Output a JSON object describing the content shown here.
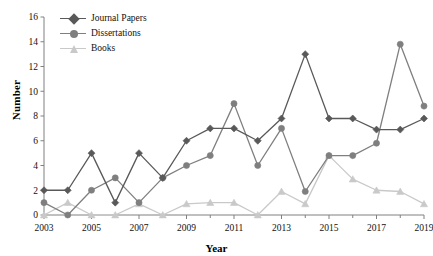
{
  "chart_data": {
    "type": "line",
    "title": "",
    "xlabel": "Year",
    "ylabel": "Number",
    "x": [
      2003,
      2004,
      2005,
      2006,
      2007,
      2008,
      2009,
      2010,
      2011,
      2012,
      2013,
      2014,
      2015,
      2016,
      2017,
      2018,
      2019
    ],
    "xlim": [
      2003,
      2019
    ],
    "ylim": [
      0,
      16
    ],
    "ytick_labels": [
      "0",
      "2",
      "4",
      "6",
      "8",
      "10",
      "12",
      "14",
      "16"
    ],
    "yticks": [
      0,
      2,
      4,
      6,
      8,
      10,
      12,
      14,
      16
    ],
    "xtick_labels": [
      "2003",
      "2005",
      "2007",
      "2009",
      "2011",
      "2013",
      "2015",
      "2017",
      "2019"
    ],
    "xticks": [
      2003,
      2005,
      2007,
      2009,
      2011,
      2013,
      2015,
      2017,
      2019
    ],
    "grid": false,
    "legend_position": "top-left",
    "series": [
      {
        "name": "Journal Papers",
        "marker": "diamond",
        "color": "#595959",
        "values": [
          2,
          2,
          5,
          1,
          5,
          3,
          6,
          7,
          7,
          6,
          7.8,
          13,
          7.8,
          7.8,
          6.9,
          6.9,
          7.8
        ]
      },
      {
        "name": "Dissertations",
        "marker": "circle",
        "color": "#7f7f7f",
        "values": [
          1,
          0,
          2,
          3,
          1,
          3,
          4,
          4.8,
          9,
          4,
          7,
          1.9,
          4.8,
          4.8,
          5.8,
          13.8,
          8.8
        ]
      },
      {
        "name": "Books",
        "marker": "triangle",
        "color": "#c9c9c9",
        "values": [
          0,
          1,
          0,
          0,
          0.9,
          0,
          0.9,
          1,
          1,
          0,
          1.9,
          0.9,
          4.8,
          2.9,
          2,
          1.9,
          0.9
        ]
      }
    ]
  },
  "axes": {
    "ylabel": "Number",
    "xlabel": "Year"
  },
  "legend": {
    "items": [
      {
        "label": "Journal Papers"
      },
      {
        "label": "Dissertations"
      },
      {
        "label": "Books"
      }
    ]
  }
}
